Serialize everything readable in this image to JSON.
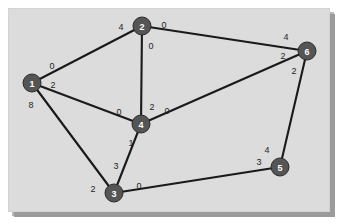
{
  "figure": {
    "title": "",
    "background_color": "#dcdcdc",
    "node_color": "#555555",
    "node_text_color": "#ffffff",
    "edge_color": "#1a1a1a",
    "label_color": "#1f1f1f"
  },
  "chart_data": {
    "type": "diagram",
    "diagram_kind": "undirected-graph",
    "title": "",
    "node_count": 6,
    "edge_count": 9,
    "nodes": [
      {
        "id": "1",
        "label": "1",
        "x": 23,
        "y": 74,
        "r": 9
      },
      {
        "id": "2",
        "label": "2",
        "x": 133,
        "y": 17,
        "r": 9
      },
      {
        "id": "3",
        "label": "3",
        "x": 105,
        "y": 184,
        "r": 9
      },
      {
        "id": "4",
        "label": "4",
        "x": 132,
        "y": 115,
        "r": 9
      },
      {
        "id": "5",
        "label": "5",
        "x": 271,
        "y": 158,
        "r": 9
      },
      {
        "id": "6",
        "label": "6",
        "x": 298,
        "y": 42,
        "r": 9
      }
    ],
    "edges": [
      {
        "id": "edge-1-2",
        "from": "1",
        "to": "2",
        "label_from": "0",
        "label_to": "4",
        "label_from_x": 43,
        "label_from_y": 57,
        "label_to_x": 112,
        "label_to_y": 18
      },
      {
        "id": "edge-1-4",
        "from": "1",
        "to": "4",
        "label_from": "2",
        "label_to": "0",
        "label_from_x": 44,
        "label_from_y": 76,
        "label_to_x": 110,
        "label_to_y": 103
      },
      {
        "id": "edge-1-3",
        "from": "1",
        "to": "3",
        "label_from": "8",
        "label_to": "2",
        "label_from_x": 22,
        "label_from_y": 96,
        "label_to_x": 84,
        "label_to_y": 180
      },
      {
        "id": "edge-2-4",
        "from": "2",
        "to": "4",
        "label_from": "0",
        "label_to": "2",
        "label_from_x": 142,
        "label_from_y": 37,
        "label_to_x": 143,
        "label_to_y": 98
      },
      {
        "id": "edge-2-6",
        "from": "2",
        "to": "6",
        "label_from": "0",
        "label_to": "4",
        "label_from_x": 155,
        "label_from_y": 16,
        "label_to_x": 277,
        "label_to_y": 28
      },
      {
        "id": "edge-4-6",
        "from": "4",
        "to": "6",
        "label_from": "0",
        "label_to": "2",
        "label_from_x": 158,
        "label_from_y": 102,
        "label_to_x": 274,
        "label_to_y": 47
      },
      {
        "id": "edge-3-4",
        "from": "3",
        "to": "4",
        "label_from": "3",
        "label_to": "1",
        "label_from_x": 107,
        "label_from_y": 157,
        "label_to_x": 122,
        "label_to_y": 134
      },
      {
        "id": "edge-3-5",
        "from": "3",
        "to": "5",
        "label_from": "0",
        "label_to": "3",
        "label_from_x": 130,
        "label_from_y": 177,
        "label_to_x": 250,
        "label_to_y": 153
      },
      {
        "id": "edge-5-6",
        "from": "5",
        "to": "6",
        "label_from": "4",
        "label_to": "2",
        "label_from_x": 258,
        "label_from_y": 141,
        "label_to_x": 285,
        "label_to_y": 62
      }
    ]
  }
}
